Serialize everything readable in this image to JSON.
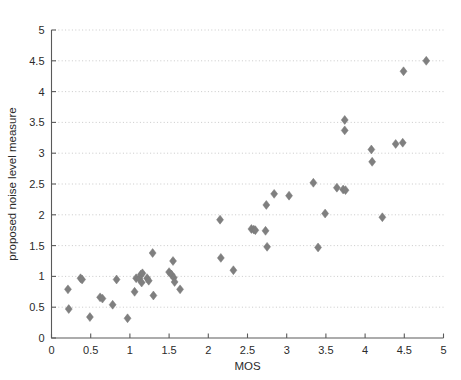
{
  "figure": {
    "caption_remnant": "",
    "marker_color": "#7f7f7f",
    "grid_color": "#bdbdbd",
    "axis_color": "#5a5a5a",
    "background": "#ffffff"
  },
  "chart_data": {
    "type": "scatter",
    "title": "",
    "xlabel": "MOS",
    "ylabel": "proposed noise level measure",
    "xlim": [
      0,
      5
    ],
    "ylim": [
      0,
      5
    ],
    "xticks": [
      0,
      0.5,
      1,
      1.5,
      2,
      2.5,
      3,
      3.5,
      4,
      4.5,
      5
    ],
    "xtick_labels": [
      "0",
      "0.5",
      "1",
      "1.5",
      "2",
      "2.5",
      "3",
      "3.5",
      "4",
      "4.5",
      "5"
    ],
    "yticks": [
      0,
      0.5,
      1,
      1.5,
      2,
      2.5,
      3,
      3.5,
      4,
      4.5,
      5
    ],
    "ytick_labels": [
      "0",
      "0.5",
      "1",
      "1.5",
      "2",
      "2.5",
      "3",
      "3.5",
      "4",
      "4.5",
      "5"
    ],
    "grid": true,
    "grid_axis": "y",
    "legend": null,
    "marker": "diamond",
    "marker_size": 6.5,
    "series": [
      {
        "name": "proposed noise level measure vs MOS",
        "color": "#7f7f7f",
        "points": [
          [
            0.21,
            0.79
          ],
          [
            0.22,
            0.47
          ],
          [
            0.37,
            0.97
          ],
          [
            0.39,
            0.95
          ],
          [
            0.49,
            0.34
          ],
          [
            0.62,
            0.66
          ],
          [
            0.65,
            0.64
          ],
          [
            0.78,
            0.54
          ],
          [
            0.83,
            0.95
          ],
          [
            0.97,
            0.32
          ],
          [
            1.06,
            0.75
          ],
          [
            1.08,
            0.97
          ],
          [
            1.12,
            0.96
          ],
          [
            1.14,
            1.03
          ],
          [
            1.16,
            1.05
          ],
          [
            1.15,
            0.9
          ],
          [
            1.22,
            0.97
          ],
          [
            1.24,
            0.93
          ],
          [
            1.29,
            1.38
          ],
          [
            1.3,
            0.69
          ],
          [
            1.5,
            1.07
          ],
          [
            1.53,
            1.03
          ],
          [
            1.55,
            1.25
          ],
          [
            1.56,
            0.98
          ],
          [
            1.57,
            0.91
          ],
          [
            1.64,
            0.79
          ],
          [
            2.15,
            1.92
          ],
          [
            2.16,
            1.3
          ],
          [
            2.32,
            1.1
          ],
          [
            2.55,
            1.77
          ],
          [
            2.58,
            1.76
          ],
          [
            2.6,
            1.75
          ],
          [
            2.73,
            1.74
          ],
          [
            2.74,
            2.16
          ],
          [
            2.75,
            1.48
          ],
          [
            2.84,
            2.34
          ],
          [
            3.03,
            2.31
          ],
          [
            3.34,
            2.52
          ],
          [
            3.4,
            1.47
          ],
          [
            3.49,
            2.02
          ],
          [
            3.64,
            2.44
          ],
          [
            3.72,
            2.41
          ],
          [
            3.75,
            2.4
          ],
          [
            3.74,
            3.54
          ],
          [
            3.74,
            3.37
          ],
          [
            4.08,
            3.06
          ],
          [
            4.09,
            2.86
          ],
          [
            4.22,
            1.96
          ],
          [
            4.39,
            3.15
          ],
          [
            4.48,
            3.17
          ],
          [
            4.49,
            4.33
          ],
          [
            4.78,
            4.5
          ]
        ]
      }
    ]
  }
}
